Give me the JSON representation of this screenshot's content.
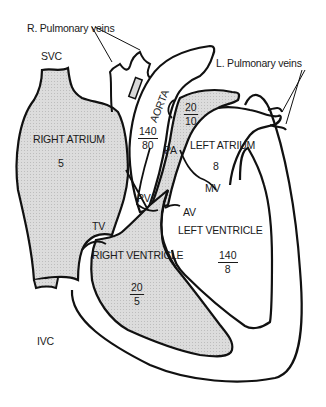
{
  "diagram": {
    "colors": {
      "stroke": "#111111",
      "right_side_fill": "#d8d8d8",
      "left_side_fill": "#ffffff",
      "background": "#ffffff"
    },
    "labels": {
      "r_pulmonary_veins": "R. Pulmonary veins",
      "l_pulmonary_veins": "L. Pulmonary veins",
      "svc": "SVC",
      "ivc": "IVC",
      "aorta": "AORTA",
      "pa": "PA",
      "pv": "PV",
      "tv": "TV",
      "mv": "MV",
      "av": "AV",
      "right_atrium": "RIGHT ATRIUM",
      "left_atrium": "LEFT ATRIUM",
      "right_ventricle": "RIGHT VENTRICLE",
      "left_ventricle": "LEFT VENTRICLE"
    },
    "pressures": {
      "right_atrium": "5",
      "left_atrium": "8",
      "aorta": {
        "systolic": "140",
        "diastolic": "80"
      },
      "pulmonary_artery": {
        "systolic": "20",
        "diastolic": "10"
      },
      "right_ventricle": {
        "systolic": "20",
        "diastolic": "5"
      },
      "left_ventricle": {
        "systolic": "140",
        "diastolic": "8"
      }
    }
  }
}
